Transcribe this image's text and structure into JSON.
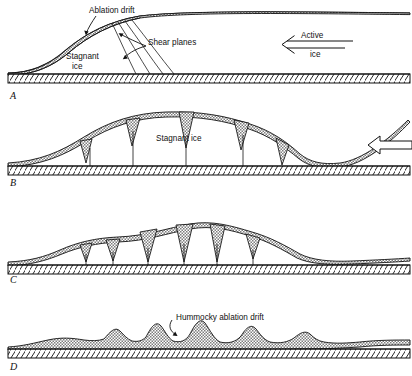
{
  "figure": {
    "title_cut_off": "",
    "panels": [
      {
        "letter": "A",
        "labels": [
          {
            "name": "ablation-drift",
            "text": "Ablation drift"
          },
          {
            "name": "shear-planes",
            "text": "Shear planes"
          },
          {
            "name": "stagnant-ice-line1",
            "text": "Stagnant"
          },
          {
            "name": "stagnant-ice-line2",
            "text": "ice"
          },
          {
            "name": "active-ice-line1",
            "text": "Active"
          },
          {
            "name": "active-ice-line2",
            "text": "ice"
          }
        ]
      },
      {
        "letter": "B",
        "labels": [
          {
            "name": "stagnant-ice",
            "text": "Stagnant  ice"
          }
        ]
      },
      {
        "letter": "C",
        "labels": []
      },
      {
        "letter": "D",
        "labels": [
          {
            "name": "hummocky-ablation-drift",
            "text": "Hummocky  ablation  drift"
          }
        ]
      }
    ],
    "colors": {
      "ink": "#111111",
      "drift_fill": "#9a9a9a",
      "ground_fill": "#ffffff",
      "background": "#ffffff"
    }
  }
}
